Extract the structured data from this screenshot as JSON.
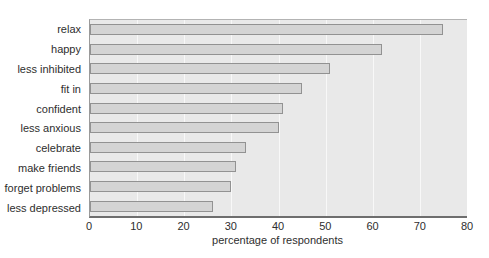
{
  "chart_data": {
    "type": "bar",
    "orientation": "horizontal",
    "title": "",
    "categories": [
      "relax",
      "happy",
      "less inhibited",
      "fit in",
      "confident",
      "less anxious",
      "celebrate",
      "make friends",
      "forget problems",
      "less depressed"
    ],
    "values": [
      75,
      62,
      51,
      45,
      41,
      40,
      33,
      31,
      30,
      26
    ],
    "xlabel": "percentage of respondents",
    "xlim": [
      0,
      80
    ],
    "xticks": [
      0,
      10,
      20,
      30,
      40,
      50,
      60,
      70,
      80
    ],
    "grid": "vertical",
    "legend_position": "none",
    "colors": {
      "bar_fill": "#d4d4d4",
      "bar_border": "#929292",
      "plot_background": "#e9e9e9",
      "gridline": "#f8f8f8",
      "axis_line": "#6e6e6e",
      "text": "#2e2e2e",
      "page_background": "#ffffff"
    }
  }
}
